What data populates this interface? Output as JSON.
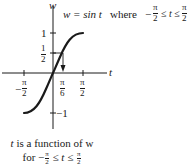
{
  "figure": {
    "axes": {
      "vertical_label": "w",
      "horizontal_label": "t",
      "y_ticks": [
        {
          "label": "1",
          "value": 1
        },
        {
          "num": "1",
          "den": "2",
          "value": 0.5
        },
        {
          "label": "−1",
          "value": -1
        }
      ],
      "x_ticks": [
        {
          "sign": "−",
          "num": "π",
          "den": "2",
          "value": -1.5708
        },
        {
          "num": "π",
          "den": "6",
          "value": 0.5236
        },
        {
          "num": "π",
          "den": "2",
          "value": 1.5708
        }
      ]
    },
    "equation": {
      "lhs": "w = sin t",
      "where": "where",
      "minus": "−",
      "num_left": "π",
      "den_left": "2",
      "relation": "≤ t ≤",
      "num_right": "π",
      "den_right": "2"
    },
    "curve": {
      "function": "w = sin t",
      "domain": [
        -1.5708,
        1.5708
      ],
      "stroke": "#1a1a1a"
    },
    "marker": {
      "description": "horizontal line from w=1/2 to curve, arrow down to t=π/6",
      "from_w": 0.5,
      "to_t": 0.5236
    },
    "caption": {
      "line1_t": "t",
      "line1_rest": " is a function of w",
      "line2_for": "for ",
      "line2_minus": "−",
      "line2_num_left": "π",
      "line2_den_left": "2",
      "line2_relation": " ≤ t ≤ ",
      "line2_num_right": "π",
      "line2_den_right": "2"
    }
  }
}
